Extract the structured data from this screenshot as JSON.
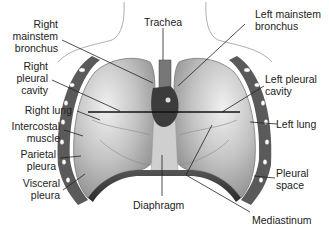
{
  "diagram": {
    "labels": {
      "trachea": "Trachea",
      "right_mainstem_bronchus": [
        "Right",
        "mainstem",
        "bronchus"
      ],
      "left_mainstem_bronchus": [
        "Left mainstem",
        "bronchus"
      ],
      "right_pleural_cavity": [
        "Right",
        "pleural",
        "cavity"
      ],
      "left_pleural_cavity": [
        "Left pleural",
        "cavity"
      ],
      "right_lung": "Right lung",
      "left_lung": "Left lung",
      "intercostal_muscle": [
        "Intercostal",
        "muscle"
      ],
      "parietal_pleura": [
        "Parietal",
        "pleura"
      ],
      "visceral_pleura": [
        "Visceral",
        "pleura"
      ],
      "pleural_space": [
        "Pleural",
        "space"
      ],
      "diaphragm": "Diaphragm",
      "mediastinum": "Mediastinum"
    },
    "colors": {
      "background": "#ffffff",
      "lung_light": "#d8d8d8",
      "lung_mid": "#a9a9a9",
      "lung_dark": "#6e6e6e",
      "heart": "#3c3c3c",
      "leader_line": "#222222",
      "text": "#222222"
    }
  }
}
